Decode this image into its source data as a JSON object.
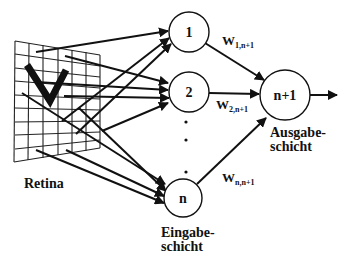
{
  "diagram": {
    "type": "neural-network-perceptron",
    "retina": {
      "label": "Retina",
      "pattern_letter": "V",
      "grid_cols": 6,
      "grid_rows": 9
    },
    "input_layer": {
      "label_line1": "Eingabe-",
      "label_line2": "schicht",
      "nodes": [
        {
          "id": "1",
          "label": "1"
        },
        {
          "id": "2",
          "label": "2"
        },
        {
          "id": "n",
          "label": "n"
        }
      ],
      "ellipsis": "· · ·"
    },
    "output_layer": {
      "label_line1": "Ausgabe-",
      "label_line2": "schicht",
      "node": {
        "id": "n+1",
        "label": "n+1"
      }
    },
    "weights": [
      {
        "main": "W",
        "sub": "1,n+1"
      },
      {
        "main": "W",
        "sub": "2,n+1"
      },
      {
        "main": "W",
        "sub": "n,n+1"
      }
    ],
    "colors": {
      "stroke": "#111111",
      "background": "#ffffff"
    }
  }
}
